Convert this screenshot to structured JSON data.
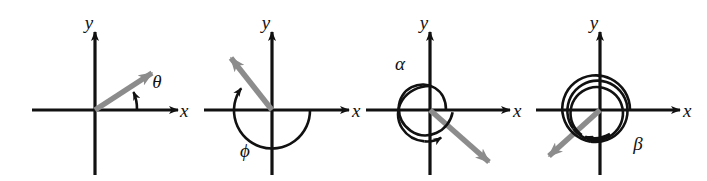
{
  "figure": {
    "background_color": "#ffffff",
    "axis_color": "#111111",
    "vector_color": "#8c8c8c",
    "arc_color": "#111111",
    "panel_count": 4
  },
  "panels": [
    {
      "id": "panel-theta",
      "angle_symbol": "θ",
      "x_axis_label": "x",
      "y_axis_label": "y",
      "origin": {
        "x": 95,
        "y": 110
      },
      "terminal_ray_angle_deg": 30,
      "rotation_turns": 0.083,
      "rotation_direction": "counterclockwise",
      "arc_turns_drawn": 0.083,
      "angle_label_position": {
        "x": 157,
        "y": 88
      },
      "x_label_position": {
        "x": 180,
        "y": 116
      },
      "y_label_position": {
        "x": 89,
        "y": 28
      }
    },
    {
      "id": "panel-phi",
      "angle_symbol": "ϕ",
      "x_axis_label": "x",
      "y_axis_label": "y",
      "origin": {
        "x": 272,
        "y": 110
      },
      "terminal_ray_angle_deg": 118,
      "rotation_turns": -0.672,
      "rotation_direction": "clockwise",
      "arc_turns_drawn": 0.672,
      "angle_label_position": {
        "x": 245,
        "y": 155
      },
      "x_label_position": {
        "x": 352,
        "y": 116
      },
      "y_label_position": {
        "x": 266,
        "y": 28
      }
    },
    {
      "id": "panel-alpha",
      "angle_symbol": "α",
      "x_axis_label": "x",
      "y_axis_label": "y",
      "origin": {
        "x": 430,
        "y": 110
      },
      "terminal_ray_angle_deg": -56,
      "rotation_turns": 1.845,
      "rotation_direction": "counterclockwise",
      "arc_turns_drawn": 1.845,
      "angle_label_position": {
        "x": 400,
        "y": 68
      },
      "x_label_position": {
        "x": 513,
        "y": 116
      },
      "y_label_position": {
        "x": 424,
        "y": 28
      }
    },
    {
      "id": "panel-beta",
      "angle_symbol": "β",
      "x_axis_label": "x",
      "y_axis_label": "y",
      "origin": {
        "x": 600,
        "y": 110
      },
      "terminal_ray_angle_deg": -139,
      "rotation_turns": -2.614,
      "rotation_direction": "clockwise",
      "arc_turns_drawn": 2.614,
      "angle_label_position": {
        "x": 638,
        "y": 148
      },
      "x_label_position": {
        "x": 683,
        "y": 116
      },
      "y_label_position": {
        "x": 594,
        "y": 28
      }
    }
  ]
}
